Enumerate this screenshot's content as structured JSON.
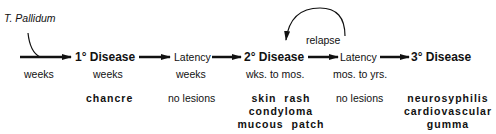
{
  "pathogen": "T. Pallidum",
  "relapse_label": "relapse",
  "stages": [
    {
      "label": "",
      "duration": "weeks",
      "lesions": []
    },
    {
      "label": "1° Disease",
      "duration": "weeks",
      "lesions": [
        "chancre"
      ]
    },
    {
      "label": "Latency",
      "duration": "weeks",
      "lesions": [
        "no lesions"
      ]
    },
    {
      "label": "2° Disease",
      "duration": "wks. to mos.",
      "lesions": [
        "skin  rash",
        "condyloma",
        "mucous  patch"
      ]
    },
    {
      "label": "Latency",
      "duration": "mos. to yrs.",
      "lesions": [
        "no lesions"
      ]
    },
    {
      "label": "3° Disease",
      "duration": "",
      "lesions": [
        "neurosyphilis",
        "cardiovascular",
        "gumma"
      ]
    }
  ]
}
